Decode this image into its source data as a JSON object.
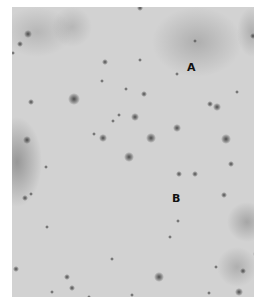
{
  "figure": {
    "type": "grayscale micrograph",
    "background_color": "#d2d2d2",
    "labels": [
      {
        "text": "A",
        "x": 187,
        "y": 62
      },
      {
        "text": "B",
        "x": 172,
        "y": 193
      }
    ],
    "hazes": [
      {
        "x": 140,
        "y": 0,
        "w": 90,
        "h": 70,
        "color": "rgba(110,110,110,0.35)"
      },
      {
        "x": -20,
        "y": 110,
        "w": 50,
        "h": 90,
        "color": "rgba(80,80,80,0.45)"
      },
      {
        "x": -10,
        "y": 0,
        "w": 70,
        "h": 50,
        "color": "rgba(120,120,120,0.3)"
      },
      {
        "x": 40,
        "y": 0,
        "w": 40,
        "h": 40,
        "color": "rgba(120,120,120,0.3)"
      },
      {
        "x": 215,
        "y": 195,
        "w": 40,
        "h": 40,
        "color": "rgba(100,100,100,0.4)"
      },
      {
        "x": 205,
        "y": 240,
        "w": 40,
        "h": 40,
        "color": "rgba(110,110,110,0.35)"
      },
      {
        "x": 225,
        "y": 0,
        "w": 30,
        "h": 50,
        "color": "rgba(110,110,110,0.35)"
      }
    ],
    "spots": [
      {
        "x": 16,
        "y": 27,
        "r": 4
      },
      {
        "x": 8,
        "y": 37,
        "r": 3
      },
      {
        "x": 1,
        "y": 46,
        "r": 2
      },
      {
        "x": 62,
        "y": 92,
        "r": 6
      },
      {
        "x": 19,
        "y": 95,
        "r": 3
      },
      {
        "x": 93,
        "y": 55,
        "r": 3
      },
      {
        "x": 128,
        "y": 53,
        "r": 2
      },
      {
        "x": 90,
        "y": 74,
        "r": 2
      },
      {
        "x": 114,
        "y": 82,
        "r": 2
      },
      {
        "x": 132,
        "y": 87,
        "r": 3
      },
      {
        "x": 123,
        "y": 110,
        "r": 4
      },
      {
        "x": 165,
        "y": 121,
        "r": 4
      },
      {
        "x": 205,
        "y": 100,
        "r": 4
      },
      {
        "x": 198,
        "y": 97,
        "r": 3
      },
      {
        "x": 139,
        "y": 131,
        "r": 5
      },
      {
        "x": 214,
        "y": 132,
        "r": 5
      },
      {
        "x": 91,
        "y": 131,
        "r": 4
      },
      {
        "x": 82,
        "y": 127,
        "r": 2
      },
      {
        "x": 15,
        "y": 133,
        "r": 4
      },
      {
        "x": 101,
        "y": 114,
        "r": 2
      },
      {
        "x": 165,
        "y": 67,
        "r": 2
      },
      {
        "x": 241,
        "y": 29,
        "r": 3
      },
      {
        "x": 183,
        "y": 34,
        "r": 2
      },
      {
        "x": 225,
        "y": 85,
        "r": 2
      },
      {
        "x": 128,
        "y": 1,
        "r": 3
      },
      {
        "x": 107,
        "y": 108,
        "r": 2
      },
      {
        "x": 117,
        "y": 150,
        "r": 5
      },
      {
        "x": 167,
        "y": 167,
        "r": 3
      },
      {
        "x": 183,
        "y": 167,
        "r": 3
      },
      {
        "x": 219,
        "y": 157,
        "r": 3
      },
      {
        "x": 212,
        "y": 188,
        "r": 3
      },
      {
        "x": 13,
        "y": 191,
        "r": 3
      },
      {
        "x": 19,
        "y": 187,
        "r": 2
      },
      {
        "x": 34,
        "y": 160,
        "r": 2
      },
      {
        "x": 166,
        "y": 214,
        "r": 2
      },
      {
        "x": 158,
        "y": 230,
        "r": 2
      },
      {
        "x": 35,
        "y": 220,
        "r": 2
      },
      {
        "x": 55,
        "y": 270,
        "r": 3
      },
      {
        "x": 245,
        "y": 247,
        "r": 4
      },
      {
        "x": 231,
        "y": 264,
        "r": 3
      },
      {
        "x": 204,
        "y": 260,
        "r": 2
      },
      {
        "x": 147,
        "y": 270,
        "r": 5
      },
      {
        "x": 60,
        "y": 281,
        "r": 3
      },
      {
        "x": 40,
        "y": 285,
        "r": 2
      },
      {
        "x": 227,
        "y": 285,
        "r": 4
      },
      {
        "x": 197,
        "y": 286,
        "r": 2
      },
      {
        "x": 4,
        "y": 262,
        "r": 3
      },
      {
        "x": 77,
        "y": 290,
        "r": 2
      },
      {
        "x": 120,
        "y": 288,
        "r": 2
      },
      {
        "x": 100,
        "y": 252,
        "r": 2
      }
    ]
  }
}
